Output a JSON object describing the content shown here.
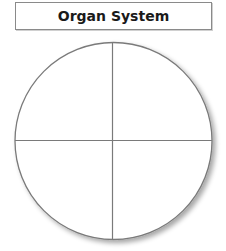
{
  "title": {
    "label": "Organ System"
  },
  "diagram": {
    "type": "quartered-circle",
    "center": [
      113.5,
      141
    ],
    "radius": 98.5,
    "quadrants": 4,
    "stroke_color": "#7a7a7a",
    "shadow_color": "#bbbbbb",
    "fill_color": "#ffffff"
  }
}
